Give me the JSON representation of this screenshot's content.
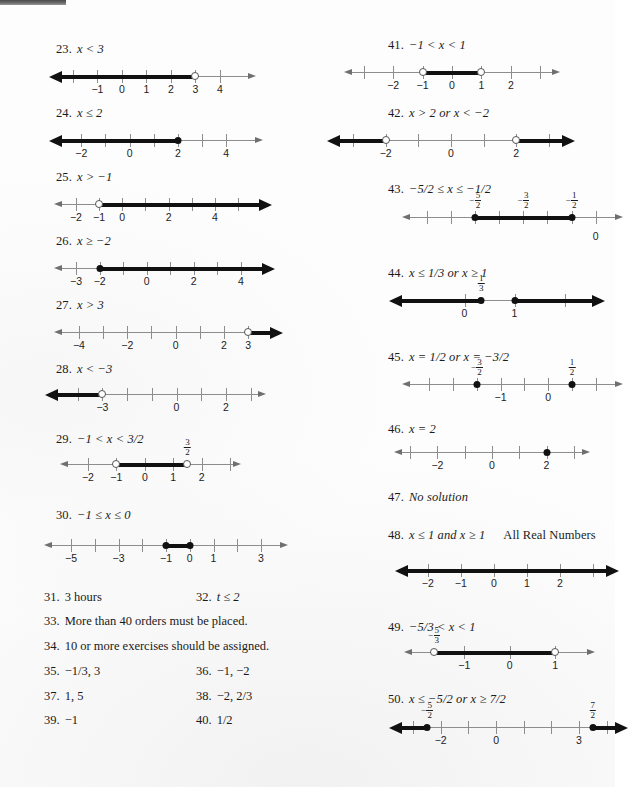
{
  "page": {
    "kind": "textbook-answer-key-scan",
    "width": 615,
    "height": 787,
    "ink_color": "#111111",
    "axis_color": "#8d8d8d"
  },
  "left_column": {
    "problems": [
      {
        "number": "23.",
        "statement": "x < 3",
        "ticks": [
          {
            "v": -2,
            "label": ""
          },
          {
            "v": -1,
            "label": "−1"
          },
          {
            "v": 0,
            "label": "0"
          },
          {
            "v": 1,
            "label": "1"
          },
          {
            "v": 2,
            "label": "2"
          },
          {
            "v": 3,
            "label": "3"
          },
          {
            "v": 4,
            "label": "4"
          }
        ],
        "segment": {
          "from": "-inf",
          "to": 3
        },
        "endpoints": [
          {
            "v": 3,
            "type": "open"
          }
        ]
      },
      {
        "number": "24.",
        "statement": "x ≤ 2",
        "ticks": [
          {
            "v": -2,
            "label": "−2"
          },
          {
            "v": -1,
            "label": ""
          },
          {
            "v": 0,
            "label": "0"
          },
          {
            "v": 1,
            "label": ""
          },
          {
            "v": 2,
            "label": "2"
          },
          {
            "v": 3,
            "label": ""
          },
          {
            "v": 4,
            "label": "4"
          }
        ],
        "segment": {
          "from": "-inf",
          "to": 2
        },
        "endpoints": [
          {
            "v": 2,
            "type": "closed"
          }
        ]
      },
      {
        "number": "25.",
        "statement": "x > −1",
        "ticks": [
          {
            "v": -2,
            "label": "−2"
          },
          {
            "v": -1,
            "label": "−1"
          },
          {
            "v": 0,
            "label": "0"
          },
          {
            "v": 1,
            "label": ""
          },
          {
            "v": 2,
            "label": "2"
          },
          {
            "v": 3,
            "label": ""
          },
          {
            "v": 4,
            "label": "4"
          },
          {
            "v": 5,
            "label": ""
          }
        ],
        "segment": {
          "from": -1,
          "to": "+inf"
        },
        "endpoints": [
          {
            "v": -1,
            "type": "open"
          }
        ]
      },
      {
        "number": "26.",
        "statement": "x ≥ −2",
        "ticks": [
          {
            "v": -3,
            "label": "−3"
          },
          {
            "v": -2,
            "label": "−2"
          },
          {
            "v": -1,
            "label": ""
          },
          {
            "v": 0,
            "label": "0"
          },
          {
            "v": 1,
            "label": ""
          },
          {
            "v": 2,
            "label": "2"
          },
          {
            "v": 3,
            "label": ""
          },
          {
            "v": 4,
            "label": "4"
          }
        ],
        "segment": {
          "from": -2,
          "to": "+inf"
        },
        "endpoints": [
          {
            "v": -2,
            "type": "closed"
          }
        ]
      },
      {
        "number": "27.",
        "statement": "x > 3",
        "ticks": [
          {
            "v": -4,
            "label": "−4"
          },
          {
            "v": -3,
            "label": ""
          },
          {
            "v": -2,
            "label": "−2"
          },
          {
            "v": -1,
            "label": ""
          },
          {
            "v": 0,
            "label": "0"
          },
          {
            "v": 1,
            "label": ""
          },
          {
            "v": 2,
            "label": "2"
          },
          {
            "v": 3,
            "label": "3"
          }
        ],
        "segment": {
          "from": 3,
          "to": "+inf"
        },
        "endpoints": [
          {
            "v": 3,
            "type": "open"
          }
        ]
      },
      {
        "number": "28.",
        "statement": "x < −3",
        "ticks": [
          {
            "v": -4,
            "label": ""
          },
          {
            "v": -3,
            "label": "−3"
          },
          {
            "v": -2,
            "label": ""
          },
          {
            "v": -1,
            "label": ""
          },
          {
            "v": 0,
            "label": "0"
          },
          {
            "v": 1,
            "label": ""
          },
          {
            "v": 2,
            "label": "2"
          },
          {
            "v": 3,
            "label": ""
          }
        ],
        "segment": {
          "from": "-inf",
          "to": -3
        },
        "endpoints": [
          {
            "v": -3,
            "type": "open"
          }
        ]
      },
      {
        "number": "29.",
        "statement": "−1 < x < 3/2",
        "ticks": [
          {
            "v": -2,
            "label": "−2"
          },
          {
            "v": -1,
            "label": "−1"
          },
          {
            "v": 0,
            "label": "0"
          },
          {
            "v": 1,
            "label": "1"
          },
          {
            "v": 2,
            "label": "2"
          },
          {
            "v": 3,
            "label": ""
          }
        ],
        "segment": {
          "from": -1,
          "to": 1.5
        },
        "endpoints": [
          {
            "v": -1,
            "type": "open"
          },
          {
            "v": 1.5,
            "type": "open"
          }
        ],
        "fraction_labels": [
          {
            "v": 1.5,
            "sign": "",
            "num": "3",
            "den": "2"
          }
        ]
      },
      {
        "number": "30.",
        "statement": "−1 ≤ x ≤ 0",
        "ticks": [
          {
            "v": -5,
            "label": "−5"
          },
          {
            "v": -4,
            "label": ""
          },
          {
            "v": -3,
            "label": "−3"
          },
          {
            "v": -2,
            "label": ""
          },
          {
            "v": -1,
            "label": "−1"
          },
          {
            "v": 0,
            "label": "0"
          },
          {
            "v": 1,
            "label": "1"
          },
          {
            "v": 2,
            "label": ""
          },
          {
            "v": 3,
            "label": "3"
          }
        ],
        "segment": {
          "from": -1,
          "to": 0
        },
        "endpoints": [
          {
            "v": -1,
            "type": "closed"
          },
          {
            "v": 0,
            "type": "closed"
          }
        ]
      }
    ],
    "answer_rows": [
      {
        "left_num": "31.",
        "left_text": "3 hours",
        "right_num": "32.",
        "right_text": "t ≤ 2",
        "right_italic_lead": true
      },
      {
        "left_num": "33.",
        "left_text": "More than 40 orders must be placed.",
        "right_num": "",
        "right_text": ""
      },
      {
        "left_num": "34.",
        "left_text": "10 or more exercises should be assigned.",
        "right_num": "",
        "right_text": ""
      },
      {
        "left_num": "35.",
        "left_text": "−1/3, 3",
        "right_num": "36.",
        "right_text": "−1, −2"
      },
      {
        "left_num": "37.",
        "left_text": "1, 5",
        "right_num": "38.",
        "right_text": "−2, 2/3"
      },
      {
        "left_num": "39.",
        "left_text": "−1",
        "right_num": "40.",
        "right_text": "1/2"
      }
    ]
  },
  "right_column": {
    "problems": [
      {
        "number": "41.",
        "statement": "−1 < x < 1",
        "ticks": [
          {
            "v": -3,
            "label": ""
          },
          {
            "v": -2,
            "label": "−2"
          },
          {
            "v": -1,
            "label": "−1"
          },
          {
            "v": 0,
            "label": "0"
          },
          {
            "v": 1,
            "label": "1"
          },
          {
            "v": 2,
            "label": "2"
          },
          {
            "v": 3,
            "label": ""
          }
        ],
        "segment": {
          "from": -1,
          "to": 1
        },
        "endpoints": [
          {
            "v": -1,
            "type": "open"
          },
          {
            "v": 1,
            "type": "open"
          }
        ]
      },
      {
        "number": "42.",
        "statement": "x > 2 or x < −2",
        "ticks": [
          {
            "v": -3,
            "label": ""
          },
          {
            "v": -2,
            "label": "−2"
          },
          {
            "v": -1,
            "label": ""
          },
          {
            "v": 0,
            "label": "0"
          },
          {
            "v": 1,
            "label": ""
          },
          {
            "v": 2,
            "label": "2"
          },
          {
            "v": 3,
            "label": ""
          }
        ],
        "segments": [
          {
            "from": "-inf",
            "to": -2
          },
          {
            "from": 2,
            "to": "+inf"
          }
        ],
        "endpoints": [
          {
            "v": -2,
            "type": "open"
          },
          {
            "v": 2,
            "type": "open"
          }
        ]
      },
      {
        "number": "43.",
        "statement": "−5/2 ≤ x ≤ −1/2",
        "ticks": [
          {
            "v": -3.5,
            "label": ""
          },
          {
            "v": -3,
            "label": ""
          },
          {
            "v": -2.5,
            "label": ""
          },
          {
            "v": -2,
            "label": ""
          },
          {
            "v": -1.5,
            "label": ""
          },
          {
            "v": -1,
            "label": ""
          },
          {
            "v": -0.5,
            "label": ""
          },
          {
            "v": 0,
            "label": "0",
            "label_low": true
          }
        ],
        "segment": {
          "from": -2.5,
          "to": -0.5
        },
        "endpoints": [
          {
            "v": -2.5,
            "type": "closed"
          },
          {
            "v": -0.5,
            "type": "closed"
          }
        ],
        "fraction_labels": [
          {
            "v": -2.5,
            "sign": "−",
            "num": "5",
            "den": "2"
          },
          {
            "v": -1.5,
            "sign": "−",
            "num": "3",
            "den": "2"
          },
          {
            "v": -0.5,
            "sign": "−",
            "num": "1",
            "den": "2"
          }
        ]
      },
      {
        "number": "44.",
        "statement": "x ≤ 1/3 or x ≥ 1",
        "ticks": [
          {
            "v": 0,
            "label": "0"
          },
          {
            "v": 1,
            "label": "1"
          },
          {
            "v": 2,
            "label": ""
          }
        ],
        "segments": [
          {
            "from": "-inf",
            "to": 0.333
          },
          {
            "from": 1,
            "to": "+inf"
          }
        ],
        "endpoints": [
          {
            "v": 0.333,
            "type": "closed"
          },
          {
            "v": 1,
            "type": "closed"
          }
        ],
        "fraction_labels": [
          {
            "v": 0.333,
            "sign": "",
            "num": "1",
            "den": "3"
          }
        ]
      },
      {
        "number": "45.",
        "statement": "x = 1/2 or x = −3/2",
        "ticks": [
          {
            "v": -2.5,
            "label": ""
          },
          {
            "v": -2,
            "label": ""
          },
          {
            "v": -1.5,
            "label": ""
          },
          {
            "v": -1,
            "label": "−1"
          },
          {
            "v": -0.5,
            "label": ""
          },
          {
            "v": 0,
            "label": "0"
          },
          {
            "v": 0.5,
            "label": ""
          },
          {
            "v": 1,
            "label": ""
          }
        ],
        "endpoints": [
          {
            "v": -1.5,
            "type": "closed"
          },
          {
            "v": 0.5,
            "type": "closed"
          }
        ],
        "fraction_labels": [
          {
            "v": -1.5,
            "sign": "−",
            "num": "3",
            "den": "2"
          },
          {
            "v": 0.5,
            "sign": "",
            "num": "1",
            "den": "2"
          }
        ]
      },
      {
        "number": "46.",
        "statement": "x = 2",
        "ticks": [
          {
            "v": -3,
            "label": ""
          },
          {
            "v": -2,
            "label": "−2"
          },
          {
            "v": -1,
            "label": ""
          },
          {
            "v": 0,
            "label": "0"
          },
          {
            "v": 1,
            "label": ""
          },
          {
            "v": 2,
            "label": "2"
          },
          {
            "v": 3,
            "label": ""
          }
        ],
        "endpoints": [
          {
            "v": 2,
            "type": "closed"
          }
        ]
      },
      {
        "number": "47.",
        "statement": "No solution",
        "no_line": true
      },
      {
        "number": "48.",
        "statement": "x ≤ 1 and x ≥ 1",
        "extra": "All Real Numbers",
        "ticks": [
          {
            "v": -2,
            "label": "−2"
          },
          {
            "v": -1,
            "label": "−1"
          },
          {
            "v": 0,
            "label": "0"
          },
          {
            "v": 1,
            "label": "1"
          },
          {
            "v": 2,
            "label": "2"
          },
          {
            "v": 3,
            "label": ""
          }
        ],
        "segment": {
          "from": "-inf",
          "to": "+inf"
        }
      },
      {
        "number": "49.",
        "statement": "−5/3 < x < 1",
        "ticks": [
          {
            "v": -1,
            "label": "−1"
          },
          {
            "v": 0,
            "label": "0"
          },
          {
            "v": 1,
            "label": "1"
          }
        ],
        "segment": {
          "from": -1.667,
          "to": 1
        },
        "endpoints": [
          {
            "v": -1.667,
            "type": "open"
          },
          {
            "v": 1,
            "type": "open"
          }
        ],
        "fraction_labels": [
          {
            "v": -1.667,
            "sign": "−",
            "num": "5",
            "den": "3"
          }
        ]
      },
      {
        "number": "50.",
        "statement": "x ≤ −5/2 or x ≥ 7/2",
        "ticks": [
          {
            "v": -3,
            "label": ""
          },
          {
            "v": -2,
            "label": "−2"
          },
          {
            "v": -1,
            "label": ""
          },
          {
            "v": 0,
            "label": "0"
          },
          {
            "v": 1,
            "label": ""
          },
          {
            "v": 2,
            "label": ""
          },
          {
            "v": 3,
            "label": "3"
          },
          {
            "v": 4,
            "label": ""
          }
        ],
        "segments": [
          {
            "from": "-inf",
            "to": -2.5
          },
          {
            "from": 3.5,
            "to": "+inf"
          }
        ],
        "endpoints": [
          {
            "v": -2.5,
            "type": "closed"
          },
          {
            "v": 3.5,
            "type": "closed"
          }
        ],
        "fraction_labels": [
          {
            "v": -2.5,
            "sign": "−",
            "num": "5",
            "den": "2"
          },
          {
            "v": 3.5,
            "sign": "",
            "num": "7",
            "den": "2"
          }
        ]
      }
    ]
  }
}
